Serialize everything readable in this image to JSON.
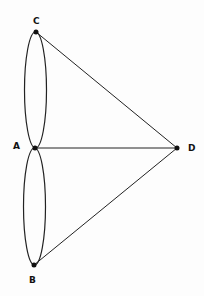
{
  "diagram": {
    "type": "multigraph",
    "nodes": [
      {
        "id": "C",
        "label": "C",
        "x": 36,
        "y": 32,
        "lx": 37,
        "ly": 24
      },
      {
        "id": "A",
        "label": "A",
        "x": 35,
        "y": 148,
        "lx": 18,
        "ly": 149
      },
      {
        "id": "B",
        "label": "B",
        "x": 34,
        "y": 265,
        "lx": 33,
        "ly": 283
      },
      {
        "id": "D",
        "label": "D",
        "x": 177,
        "y": 148,
        "lx": 192,
        "ly": 150
      }
    ],
    "edges": [
      {
        "from": "C",
        "to": "A",
        "kind": "curve-left"
      },
      {
        "from": "C",
        "to": "A",
        "kind": "curve-right"
      },
      {
        "from": "A",
        "to": "B",
        "kind": "curve-left"
      },
      {
        "from": "A",
        "to": "B",
        "kind": "curve-right"
      },
      {
        "from": "C",
        "to": "D",
        "kind": "straight"
      },
      {
        "from": "A",
        "to": "D",
        "kind": "straight"
      },
      {
        "from": "B",
        "to": "D",
        "kind": "straight"
      }
    ],
    "colors": {
      "stroke": "#222222",
      "node": "#111111",
      "background": "#fdfdfd"
    }
  }
}
